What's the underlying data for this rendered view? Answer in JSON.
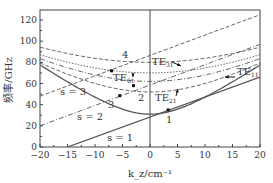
{
  "chart_data": {
    "type": "line",
    "title": "",
    "xlabel": "k_z/cm⁻¹",
    "ylabel": "频率/GHz",
    "xlim": [
      -20,
      20
    ],
    "ylim": [
      0,
      130
    ],
    "xticks": [
      -20,
      -15,
      -10,
      -5,
      0,
      5,
      10,
      15,
      20
    ],
    "yticks": [
      0,
      20,
      40,
      60,
      80,
      100,
      120
    ],
    "grid": false,
    "waveguide_modes": [
      {
        "name": "TE11",
        "label": "TE₁₁",
        "cutoff": 31,
        "slope": 3.55,
        "style": "solid"
      },
      {
        "name": "TE21",
        "label": "TE₂₁",
        "cutoff": 52,
        "slope": 3.0,
        "style": "dash"
      },
      {
        "name": "TE01",
        "label": "TE₀₁",
        "cutoff": 62,
        "slope": 2.8,
        "style": "dash-dot"
      },
      {
        "name": "TE31",
        "label": "TE₃₁",
        "cutoff": 70,
        "slope": 2.6,
        "style": "dot"
      },
      {
        "name": "upper",
        "label": "",
        "cutoff": 80,
        "slope": 2.5,
        "style": "dash"
      }
    ],
    "beam_lines": [
      {
        "name": "s=1",
        "label": "s = 1",
        "x": [
          -15,
          20
        ],
        "y": [
          0,
          66
        ],
        "style": "solid"
      },
      {
        "name": "s=2",
        "label": "s = 2",
        "x": [
          -20,
          20
        ],
        "y": [
          20,
          97
        ],
        "style": "dash-dot"
      },
      {
        "name": "s=3",
        "label": "s = 3",
        "x": [
          -20,
          20
        ],
        "y": [
          48,
          125
        ],
        "style": "dash"
      }
    ],
    "intersection_points": [
      {
        "label": "1",
        "x": 3.3,
        "y": 35
      },
      {
        "label": "2",
        "x": -5.5,
        "y": 48.5
      },
      {
        "label": "3",
        "x": -3,
        "y": 58
      },
      {
        "label": "4",
        "x": -7,
        "y": 72
      }
    ]
  }
}
